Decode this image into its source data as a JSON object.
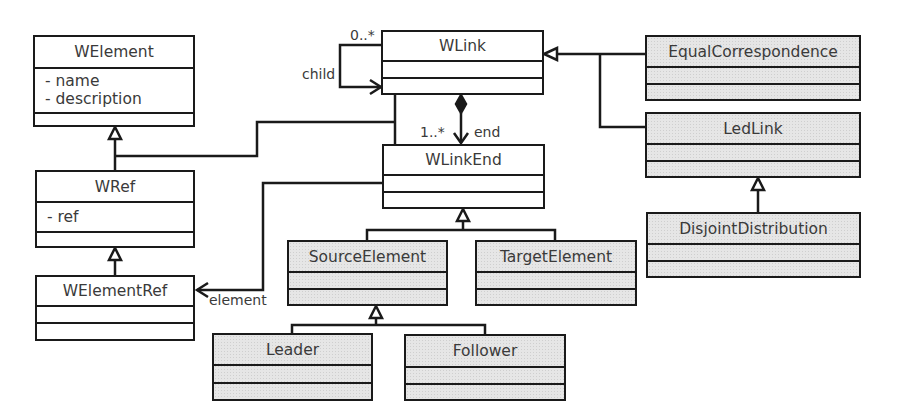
{
  "diagram": {
    "type": "UML class diagram",
    "classes": {
      "welement": {
        "name": "WElement",
        "attributes": [
          "- name",
          "- description"
        ],
        "shaded": false
      },
      "wlink": {
        "name": "WLink",
        "attributes": [],
        "shaded": false
      },
      "wlinkend": {
        "name": "WLinkEnd",
        "attributes": [],
        "shaded": false
      },
      "wref": {
        "name": "WRef",
        "attributes": [
          "- ref"
        ],
        "shaded": false
      },
      "welementref": {
        "name": "WElementRef",
        "attributes": [],
        "shaded": false
      },
      "equalcorrespondence": {
        "name": "EqualCorrespondence",
        "attributes": [],
        "shaded": true
      },
      "ledlink": {
        "name": "LedLink",
        "attributes": [],
        "shaded": true
      },
      "disjointdistribution": {
        "name": "DisjointDistribution",
        "attributes": [],
        "shaded": true
      },
      "sourceelement": {
        "name": "SourceElement",
        "attributes": [],
        "shaded": true
      },
      "targetelement": {
        "name": "TargetElement",
        "attributes": [],
        "shaded": true
      },
      "leader": {
        "name": "Leader",
        "attributes": [],
        "shaded": true
      },
      "follower": {
        "name": "Follower",
        "attributes": [],
        "shaded": true
      }
    },
    "labels": {
      "child_multiplicity": "0..*",
      "child_role": "child",
      "end_multiplicity": "1..*",
      "end_role": "end",
      "element_role": "element"
    },
    "relationships": [
      {
        "type": "generalization",
        "from": "WRef",
        "to": "WElement"
      },
      {
        "type": "generalization",
        "from": "WLink",
        "to": "WElement"
      },
      {
        "type": "generalization",
        "from": "WLinkEnd",
        "to": "WElement"
      },
      {
        "type": "generalization",
        "from": "WElementRef",
        "to": "WRef"
      },
      {
        "type": "generalization",
        "from": "EqualCorrespondence",
        "to": "WLink"
      },
      {
        "type": "generalization",
        "from": "LedLink",
        "to": "WLink"
      },
      {
        "type": "generalization",
        "from": "DisjointDistribution",
        "to": "LedLink"
      },
      {
        "type": "generalization",
        "from": "SourceElement",
        "to": "WLinkEnd"
      },
      {
        "type": "generalization",
        "from": "TargetElement",
        "to": "WLinkEnd"
      },
      {
        "type": "generalization",
        "from": "Leader",
        "to": "SourceElement"
      },
      {
        "type": "generalization",
        "from": "Follower",
        "to": "SourceElement"
      },
      {
        "type": "association",
        "from": "WLink",
        "to": "WLink",
        "role": "child",
        "multiplicity": "0..*"
      },
      {
        "type": "composition",
        "from": "WLink",
        "to": "WLinkEnd",
        "role": "end",
        "multiplicity": "1..*"
      },
      {
        "type": "association",
        "from": "WLinkEnd",
        "to": "WElementRef",
        "role": "element"
      }
    ],
    "colors": {
      "line": "#1a1a1a",
      "text": "#3a3a3a",
      "shaded_fill": "#e6e6e6",
      "plain_fill": "#ffffff"
    }
  }
}
